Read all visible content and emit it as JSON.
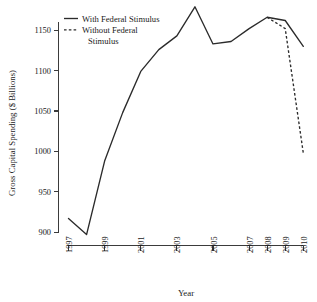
{
  "chart_data": {
    "type": "line",
    "title": "",
    "xlabel": "Year",
    "ylabel": "Gross Capital Spending ($ Billions)",
    "x": [
      1997,
      1998,
      1999,
      2000,
      2001,
      2002,
      2003,
      2004,
      2005,
      2006,
      2007,
      2008,
      2009,
      2010
    ],
    "xlim": [
      1997,
      2010
    ],
    "ylim": [
      890,
      1185
    ],
    "yticks": [
      900,
      950,
      1000,
      1050,
      1100,
      1150
    ],
    "ytick_labels": [
      "900",
      "950",
      "1000",
      "1050",
      "1100",
      "1150"
    ],
    "xticks": [
      1997,
      1999,
      2001,
      2003,
      2005,
      2007,
      2008,
      2009,
      2010
    ],
    "xtick_labels": [
      "1997",
      "1999",
      "2001",
      "2003",
      "2005",
      "2007",
      "2008",
      "2009",
      "2010"
    ],
    "grid": false,
    "legend_position": "top-left",
    "series": [
      {
        "name": "With Federal Stimulus",
        "style": "solid",
        "color": "#2b2b2b",
        "x": [
          1997,
          1998,
          1999,
          2000,
          2001,
          2002,
          2003,
          2004,
          2005,
          2006,
          2007,
          2008,
          2009,
          2010
        ],
        "values": [
          917,
          897,
          988,
          1048,
          1099,
          1126,
          1143,
          1179,
          1133,
          1136,
          1152,
          1166,
          1162,
          1130
        ]
      },
      {
        "name": "Without Federal Stimulus",
        "style": "dashed",
        "color": "#2b2b2b",
        "x": [
          2008,
          2009,
          2010
        ],
        "values": [
          1166,
          1152,
          998
        ]
      }
    ],
    "legend": [
      {
        "label": "With Federal Stimulus",
        "style": "solid"
      },
      {
        "label": "Without Federal Stimulus",
        "style": "dashed"
      }
    ]
  },
  "legend_lines": {
    "entry1_line1": "With Federal Stimulus",
    "entry2_line1": "Without Federal",
    "entry2_line2": "Stimulus"
  },
  "axis": {
    "x_title": "Year",
    "y_title": "Gross Capital Spending ($ Billions)"
  }
}
